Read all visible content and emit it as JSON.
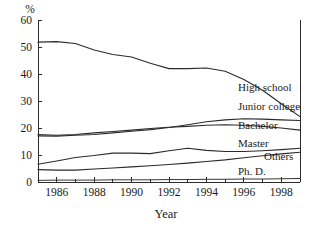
{
  "chart_data": {
    "type": "line",
    "title": "",
    "xlabel": "Year",
    "ylabel": "%",
    "ylim": [
      0,
      60
    ],
    "xlim": [
      1985,
      1999
    ],
    "grid": false,
    "legend_position": "inline-right",
    "y_ticks": [
      0,
      10,
      20,
      30,
      40,
      50,
      60
    ],
    "y_tick_labels": [
      "0",
      "10",
      "20",
      "30",
      "40",
      "50",
      "60"
    ],
    "x_ticks": [
      1986,
      1988,
      1990,
      1992,
      1994,
      1996,
      1998
    ],
    "x_tick_labels": [
      "1986",
      "1988",
      "1990",
      "1992",
      "1994",
      "1996",
      "1998"
    ],
    "x_minor_ticks": [
      1985,
      1987,
      1989,
      1991,
      1993,
      1995,
      1997,
      1999
    ],
    "x": [
      1985,
      1986,
      1987,
      1988,
      1989,
      1990,
      1991,
      1992,
      1993,
      1994,
      1995,
      1996,
      1997,
      1998,
      1999
    ],
    "series": [
      {
        "name": "High school",
        "values": [
          51.8,
          52.0,
          51.3,
          48.9,
          47.2,
          46.3,
          44.0,
          42.0,
          42.0,
          42.2,
          41.0,
          38.0,
          34.0,
          29.0,
          24.2
        ]
      },
      {
        "name": "Junior college",
        "values": [
          17.6,
          17.3,
          17.6,
          18.2,
          18.7,
          19.2,
          19.8,
          20.3,
          20.6,
          21.0,
          21.2,
          21.0,
          20.6,
          20.0,
          19.2
        ]
      },
      {
        "name": "Bachelor",
        "values": [
          17.1,
          17.0,
          17.3,
          17.6,
          18.2,
          18.8,
          19.4,
          20.2,
          21.2,
          22.3,
          23.0,
          23.4,
          23.3,
          23.0,
          22.8
        ]
      },
      {
        "name": "Master",
        "values": [
          6.6,
          7.8,
          9.1,
          9.8,
          10.7,
          10.7,
          10.5,
          11.6,
          12.5,
          11.7,
          11.3,
          11.3,
          11.6,
          12.0,
          12.5
        ]
      },
      {
        "name": "Others",
        "values": [
          4.6,
          4.4,
          4.4,
          4.8,
          5.2,
          5.6,
          6.0,
          6.5,
          7.0,
          7.6,
          8.2,
          9.0,
          9.7,
          10.4,
          11.0
        ]
      },
      {
        "name": "Ph. D.",
        "values": [
          0.6,
          0.7,
          0.7,
          0.7,
          0.8,
          0.8,
          0.8,
          0.9,
          0.9,
          1.0,
          1.0,
          1.1,
          1.1,
          1.2,
          1.3
        ]
      }
    ],
    "series_labels": [
      {
        "name": "High school",
        "text": "High school"
      },
      {
        "name": "Junior college",
        "text": "Junior college"
      },
      {
        "name": "Bachelor",
        "text": "Bachelor"
      },
      {
        "name": "Master",
        "text": "Master"
      },
      {
        "name": "Others",
        "text": "Others"
      },
      {
        "name": "Ph. D.",
        "text": "Ph. D."
      }
    ],
    "colors": {
      "line": "#2b2b2b",
      "axis": "#2b2b2b",
      "text": "#1a1a1a",
      "background": "#ffffff"
    }
  }
}
